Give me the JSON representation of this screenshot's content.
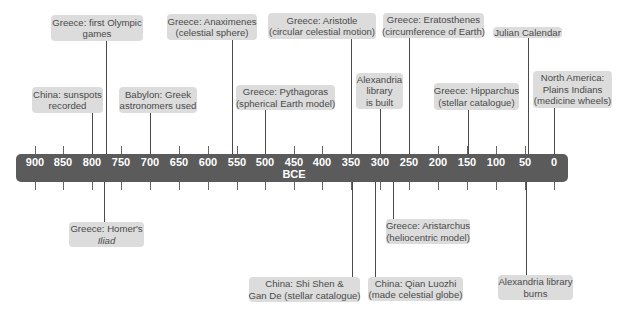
{
  "axis": {
    "era_label": "BCE",
    "ticks": [
      "900",
      "850",
      "800",
      "750",
      "700",
      "650",
      "600",
      "550",
      "500",
      "450",
      "400",
      "350",
      "300",
      "250",
      "200",
      "150",
      "100",
      "50",
      "0"
    ]
  },
  "events_above": [
    {
      "lines": [
        "China: sunspots",
        "recorded"
      ],
      "year": 800
    },
    {
      "lines": [
        "Greece: first Olympic",
        "games"
      ],
      "year": 776
    },
    {
      "lines": [
        "Babylon: Greek",
        "astronomers used"
      ],
      "year": 700
    },
    {
      "lines": [
        "Greece: Anaximenes",
        "(celestial sphere)"
      ],
      "year": 560
    },
    {
      "lines": [
        "Greece: Pythagoras",
        "(spherical Earth model)"
      ],
      "year": 500
    },
    {
      "lines": [
        "Greece: Aristotle",
        "(circular celestial motion)"
      ],
      "year": 350
    },
    {
      "lines": [
        "Alexandria",
        "library",
        "is built"
      ],
      "year": 300
    },
    {
      "lines": [
        "Greece: Eratosthenes",
        "(circumference of Earth)"
      ],
      "year": 250
    },
    {
      "lines": [
        "Greece: Hipparchus",
        "(stellar catalogue)"
      ],
      "year": 150
    },
    {
      "lines": [
        "Julian Calendar"
      ],
      "year": 46
    },
    {
      "lines": [
        "North America:",
        "Plains Indians",
        "(medicine wheels)"
      ],
      "year": 0
    }
  ],
  "events_below": [
    {
      "lines": [
        "Greece: Homer's",
        "Iliad"
      ],
      "year": 780
    },
    {
      "lines": [
        "China: Shi Shen &",
        "Gan De (stellar catalogue)"
      ],
      "year": 350
    },
    {
      "lines": [
        "China: Qian Luozhi",
        "(made celestial globe)"
      ],
      "year": 310
    },
    {
      "lines": [
        "Greece: Aristarchus",
        "(heliocentric model)"
      ],
      "year": 280
    },
    {
      "lines": [
        "Alexandria library",
        "burns"
      ],
      "year": 48
    }
  ]
}
